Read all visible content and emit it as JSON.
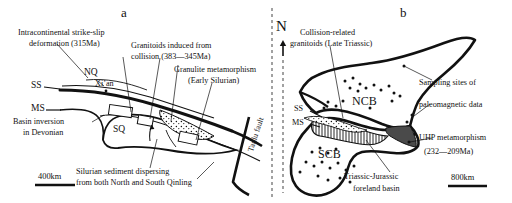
{
  "figure": {
    "panel_a": {
      "letter": "a",
      "labels": {
        "strike_slip_1": "Intracontinental strike-slip",
        "strike_slip_2": "deformation (315Ma)",
        "granitoids_1": "Granitoids induced from",
        "granitoids_2": "collision (383—345Ma)",
        "granulite_1": "Granulite metamorphism",
        "granulite_2": "(Early Silurian)",
        "basin_inv_1": "Basin inversion",
        "basin_inv_2": "in Devonian",
        "silurian_1": "Silurian sediment dispersing",
        "silurian_2": "from both North and South Qinling",
        "tanlu_fault": "Tanlu fault"
      },
      "units": {
        "ss": "SS",
        "ms": "MS",
        "nq": "NQ",
        "sq": "SQ",
        "xian": "Xi’an"
      },
      "scale": "400km"
    },
    "panel_b": {
      "letter": "b",
      "north": "N",
      "labels": {
        "collision_1": "Collision-related",
        "collision_2": "granitoids (Late Triassic)",
        "sampling_1": "Sampling sites of",
        "sampling_2": "paleomagnetic data",
        "uhp_1": "UHP metamorphism",
        "uhp_2": "(232—209Ma)",
        "foreland_1": "Triassic-Jurassic",
        "foreland_2": "foreland basin"
      },
      "units": {
        "ncb": "NCB",
        "scb": "SCB",
        "ss": "SS",
        "ms": "MS"
      },
      "scale": "800km"
    },
    "colors": {
      "ink": "#111111",
      "background": "#ffffff",
      "uhp_fill": "#4a4a4a",
      "divider": "#555555"
    },
    "icons": {
      "north_arrow": "north-arrow-icon",
      "divider": "dashed-divider-icon",
      "sample_dot": "sample-site-dot-icon"
    }
  }
}
